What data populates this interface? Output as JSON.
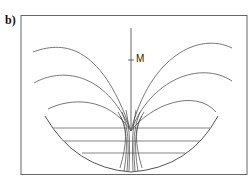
{
  "figure": {
    "panel_label": "b)",
    "point_label": "M",
    "colors": {
      "line": "#555555",
      "frame": "#666666",
      "background": "#ffffff"
    },
    "horizontal_lines_count": 3,
    "upper_arcs_per_side": 3
  }
}
